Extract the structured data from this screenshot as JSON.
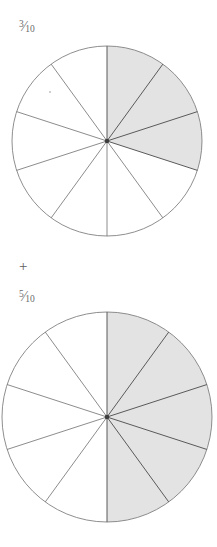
{
  "page": {
    "background_color": "#ffffff",
    "width": 217,
    "height": 547
  },
  "expression": {
    "operator": "+",
    "operator_name": "plus-sign"
  },
  "terms": [
    {
      "id": "term-1",
      "label_numerator": "3",
      "label_solidus": "⁄",
      "label_denominator": "10",
      "label_text": "3/10",
      "value": 0.3,
      "shaded_parts": 3,
      "total_parts": 10
    },
    {
      "id": "term-2",
      "label_numerator": "5",
      "label_solidus": "⁄",
      "label_denominator": "10",
      "label_text": "5/10",
      "value": 0.5,
      "shaded_parts": 5,
      "total_parts": 10
    }
  ],
  "chart_data": [
    {
      "type": "pie",
      "title": "3/10",
      "id": "pie-top",
      "categories": [
        "s1",
        "s2",
        "s3",
        "s4",
        "s5",
        "s6",
        "s7",
        "s8",
        "s9",
        "s10"
      ],
      "values": [
        1,
        1,
        1,
        1,
        1,
        1,
        1,
        1,
        1,
        1
      ],
      "total_parts": 10,
      "shaded_parts": 3,
      "shaded_indices": [
        0,
        1,
        2
      ],
      "start_angle_deg": 0,
      "direction": "clockwise",
      "shaded_color": "#e3e3e3",
      "unshaded_color": "#ffffff",
      "stroke_color": "#6e6e6e",
      "center_x": 107,
      "center_y": 141,
      "radius": 95,
      "grid": false,
      "legend": "none",
      "xlabel": "",
      "ylabel": ""
    },
    {
      "type": "pie",
      "title": "5/10",
      "id": "pie-bottom",
      "categories": [
        "s1",
        "s2",
        "s3",
        "s4",
        "s5",
        "s6",
        "s7",
        "s8",
        "s9",
        "s10"
      ],
      "values": [
        1,
        1,
        1,
        1,
        1,
        1,
        1,
        1,
        1,
        1
      ],
      "total_parts": 10,
      "shaded_parts": 5,
      "shaded_indices": [
        0,
        1,
        2,
        3,
        4
      ],
      "start_angle_deg": 0,
      "direction": "clockwise",
      "shaded_color": "#e3e3e3",
      "unshaded_color": "#ffffff",
      "stroke_color": "#6e6e6e",
      "center_x": 107,
      "center_y": 417,
      "radius": 105,
      "grid": false,
      "legend": "none",
      "xlabel": "",
      "ylabel": ""
    }
  ]
}
